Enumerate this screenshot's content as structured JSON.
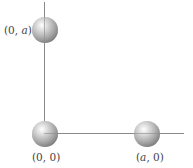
{
  "diagram": {
    "type": "point-masses-on-axes",
    "colors": {
      "axis": "#8a8a8a",
      "sphere": "#a6a6a6",
      "label": "#444444"
    },
    "points": [
      {
        "id": "top",
        "label_prefix": "(0, ",
        "label_var": "a",
        "label_suffix": ")"
      },
      {
        "id": "origin",
        "label": "(0, 0)"
      },
      {
        "id": "right",
        "label_prefix": "(",
        "label_var": "a",
        "label_suffix": ", 0)"
      }
    ]
  }
}
